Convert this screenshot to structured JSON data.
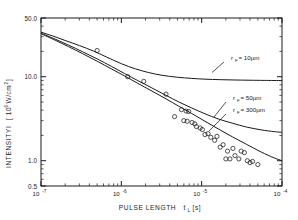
{
  "chart_data": {
    "type": "line",
    "title": "",
    "xlabel": "PULSE LENGTH  t_L [s]",
    "xlabel_parts": {
      "main": "PULSE  LENGTH",
      "sym": "t",
      "sub": "L",
      "unit": "[s]"
    },
    "ylabel": "INTENSITY  I  [10^6 W/cm^2]",
    "ylabel_parts": {
      "main": "INTENSITY",
      "sym": "I",
      "open": "[ 10",
      "exp": "6",
      "unit": "W/cm",
      "exp2": "2",
      "close": "]"
    },
    "xscale": "log",
    "yscale": "log",
    "xlim": [
      1e-07,
      0.0001
    ],
    "ylim": [
      0.5,
      50.0
    ],
    "grid": false,
    "legend_position": "inline-annotation",
    "xticks": [
      1e-07,
      1e-06,
      1e-05,
      0.0001
    ],
    "xticklabels": [
      "10-7",
      "10-6",
      "10-5",
      "10-4"
    ],
    "xtick_exponents": [
      "-7",
      "-6",
      "-5",
      "-4"
    ],
    "yticks": [
      0.5,
      1.0,
      10.0,
      50.0
    ],
    "yticklabels": [
      "0.5",
      "1.0",
      "10.0",
      "50.0"
    ],
    "series": [
      {
        "name": "r_F = 10um",
        "label_text": "= 10µm",
        "label_sym": "r",
        "label_sub": "F",
        "style": "solid",
        "points": [
          [
            1e-07,
            34.0
          ],
          [
            1.4e-07,
            30.5
          ],
          [
            2e-07,
            27.0
          ],
          [
            3e-07,
            23.5
          ],
          [
            4.5e-07,
            20.2
          ],
          [
            6.5e-07,
            17.2
          ],
          [
            1e-06,
            14.3
          ],
          [
            1.5e-06,
            12.4
          ],
          [
            2.2e-06,
            11.2
          ],
          [
            3.2e-06,
            10.4
          ],
          [
            5e-06,
            9.85
          ],
          [
            7.5e-06,
            9.55
          ],
          [
            1.1e-05,
            9.35
          ],
          [
            1.7e-05,
            9.22
          ],
          [
            2.6e-05,
            9.14
          ],
          [
            4e-05,
            9.08
          ],
          [
            6e-05,
            9.04
          ],
          [
            0.0001,
            9.0
          ]
        ]
      },
      {
        "name": "r_F = 50um",
        "label_text": "=  50µm",
        "label_sym": "r",
        "label_sub": "F",
        "style": "solid",
        "points": [
          [
            1e-07,
            33.0
          ],
          [
            1.5e-07,
            28.0
          ],
          [
            2.2e-07,
            23.8
          ],
          [
            3.3e-07,
            19.8
          ],
          [
            5e-07,
            16.3
          ],
          [
            7.5e-07,
            13.3
          ],
          [
            1.1e-06,
            10.9
          ],
          [
            1.6e-06,
            9.0
          ],
          [
            2.4e-06,
            7.35
          ],
          [
            3.6e-06,
            6.0
          ],
          [
            5.2e-06,
            5.0
          ],
          [
            7.5e-06,
            4.25
          ],
          [
            1.1e-05,
            3.62
          ],
          [
            1.6e-05,
            3.15
          ],
          [
            2.4e-05,
            2.8
          ],
          [
            3.6e-05,
            2.52
          ],
          [
            5.5e-05,
            2.33
          ],
          [
            8e-05,
            2.22
          ],
          [
            0.0001,
            2.18
          ]
        ]
      },
      {
        "name": "r_F = 300um",
        "label_text": "= 300µm",
        "label_sym": "r",
        "label_sub": "F",
        "style": "solid",
        "points": [
          [
            1e-07,
            32.5
          ],
          [
            1.5e-07,
            27.2
          ],
          [
            2.2e-07,
            22.8
          ],
          [
            3.3e-07,
            18.8
          ],
          [
            5e-07,
            15.3
          ],
          [
            7.5e-07,
            12.4
          ],
          [
            1.1e-06,
            10.2
          ],
          [
            1.6e-06,
            8.35
          ],
          [
            2.4e-06,
            6.75
          ],
          [
            3.6e-06,
            5.45
          ],
          [
            5.2e-06,
            4.45
          ],
          [
            7.5e-06,
            3.65
          ],
          [
            1.1e-05,
            2.95
          ],
          [
            1.6e-05,
            2.4
          ],
          [
            2.4e-05,
            1.93
          ],
          [
            3.6e-05,
            1.57
          ],
          [
            5.5e-05,
            1.27
          ],
          [
            8e-05,
            1.08
          ],
          [
            0.0001,
            1.0
          ]
        ]
      }
    ],
    "scatter": {
      "name": "measured data",
      "marker": "open-circle",
      "x": [
        5e-07,
        1.2e-06,
        1.9e-06,
        3.6e-06,
        4.6e-06,
        5.6e-06,
        6e-06,
        6.4e-06,
        6.6e-06,
        6.9e-06,
        7.6e-06,
        8.2e-06,
        8.6e-06,
        9.6e-06,
        1.02e-05,
        1.1e-05,
        1.2e-05,
        1.3e-05,
        1.45e-05,
        1.55e-05,
        1.7e-05,
        1.85e-05,
        2e-05,
        2.1e-05,
        2.25e-05,
        2.45e-05,
        2.6e-05,
        2.9e-05,
        3.1e-05,
        3.4e-05,
        3.7e-05,
        4e-05,
        4.3e-05,
        5e-05
      ],
      "y": [
        20.5,
        10.0,
        8.8,
        6.2,
        3.35,
        4.05,
        3.0,
        3.9,
        2.95,
        3.85,
        2.85,
        2.75,
        2.55,
        2.45,
        2.35,
        2.05,
        2.1,
        1.9,
        1.75,
        1.95,
        1.45,
        1.55,
        1.05,
        1.3,
        1.05,
        1.4,
        1.15,
        1.05,
        1.3,
        1.25,
        1.0,
        0.95,
        0.98,
        0.9
      ]
    }
  }
}
